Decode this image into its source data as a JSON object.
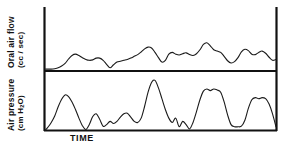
{
  "figure": {
    "background_color": "#ffffff",
    "line_color": "#1a1a1a",
    "axis_color": "#111111"
  },
  "chart_data": {
    "type": "line",
    "title": "",
    "subtitle": "",
    "xlabel": "TIME",
    "grid": false,
    "legend": null,
    "annotations": [],
    "panels": [
      {
        "id": "oral-air-flow",
        "ylabel": "Oral air flow",
        "yunits": "(cc / sec)",
        "ylabel_full": "Oral air flow (cc / sec)",
        "xlabel": "",
        "ylim": [
          0,
          1
        ],
        "xlim": [
          0,
          1
        ],
        "tick_labels_x": [],
        "tick_labels_y": [],
        "series": [
          {
            "name": "oral air flow",
            "x": [
              0.0,
              0.012,
              0.025,
              0.04,
              0.055,
              0.07,
              0.085,
              0.1,
              0.115,
              0.13,
              0.145,
              0.16,
              0.175,
              0.19,
              0.205,
              0.22,
              0.235,
              0.25,
              0.265,
              0.28,
              0.295,
              0.31,
              0.325,
              0.34,
              0.355,
              0.37,
              0.385,
              0.4,
              0.415,
              0.43,
              0.445,
              0.46,
              0.475,
              0.49,
              0.505,
              0.52,
              0.535,
              0.55,
              0.565,
              0.58,
              0.595,
              0.61,
              0.625,
              0.64,
              0.655,
              0.67,
              0.685,
              0.7,
              0.715,
              0.73,
              0.745,
              0.76,
              0.775,
              0.79,
              0.805,
              0.82,
              0.835,
              0.85,
              0.865,
              0.88,
              0.895,
              0.91,
              0.925,
              0.94,
              0.955,
              0.97,
              0.985,
              1.0
            ],
            "y": [
              0.02,
              0.02,
              0.02,
              0.03,
              0.05,
              0.09,
              0.15,
              0.25,
              0.33,
              0.36,
              0.33,
              0.28,
              0.24,
              0.22,
              0.23,
              0.27,
              0.27,
              0.22,
              0.13,
              0.05,
              0.12,
              0.18,
              0.2,
              0.22,
              0.24,
              0.27,
              0.31,
              0.35,
              0.41,
              0.48,
              0.52,
              0.5,
              0.4,
              0.28,
              0.18,
              0.22,
              0.36,
              0.4,
              0.36,
              0.34,
              0.37,
              0.39,
              0.35,
              0.33,
              0.37,
              0.46,
              0.58,
              0.62,
              0.55,
              0.46,
              0.43,
              0.4,
              0.31,
              0.21,
              0.16,
              0.19,
              0.28,
              0.41,
              0.47,
              0.44,
              0.36,
              0.35,
              0.4,
              0.43,
              0.38,
              0.29,
              0.22,
              0.24
            ]
          }
        ]
      },
      {
        "id": "air-pressure",
        "ylabel": "Air pressure",
        "yunits": "(cm H2O)",
        "ylabel_full": "Air pressure (cm H2O)",
        "xlabel": "TIME",
        "ylim": [
          0,
          1
        ],
        "xlim": [
          0,
          1
        ],
        "tick_labels_x": [],
        "tick_labels_y": [],
        "series": [
          {
            "name": "air pressure",
            "x": [
              0.0,
              0.012,
              0.025,
              0.04,
              0.055,
              0.07,
              0.085,
              0.1,
              0.115,
              0.13,
              0.145,
              0.16,
              0.175,
              0.19,
              0.205,
              0.22,
              0.235,
              0.25,
              0.265,
              0.28,
              0.295,
              0.31,
              0.325,
              0.34,
              0.355,
              0.37,
              0.385,
              0.4,
              0.415,
              0.43,
              0.445,
              0.46,
              0.475,
              0.49,
              0.505,
              0.52,
              0.535,
              0.55,
              0.565,
              0.58,
              0.595,
              0.61,
              0.625,
              0.64,
              0.655,
              0.67,
              0.685,
              0.7,
              0.715,
              0.73,
              0.745,
              0.76,
              0.775,
              0.79,
              0.805,
              0.82,
              0.835,
              0.85,
              0.865,
              0.88,
              0.895,
              0.91,
              0.925,
              0.94,
              0.955,
              0.97,
              0.985,
              1.0
            ],
            "y": [
              0.0,
              0.06,
              0.14,
              0.26,
              0.43,
              0.57,
              0.65,
              0.62,
              0.52,
              0.38,
              0.22,
              0.08,
              0.01,
              0.1,
              0.25,
              0.3,
              0.2,
              0.07,
              0.1,
              0.16,
              0.12,
              0.16,
              0.24,
              0.3,
              0.31,
              0.24,
              0.16,
              0.14,
              0.22,
              0.44,
              0.7,
              0.88,
              0.92,
              0.78,
              0.58,
              0.38,
              0.22,
              0.14,
              0.22,
              0.06,
              0.16,
              0.1,
              0.02,
              0.14,
              0.34,
              0.56,
              0.72,
              0.76,
              0.73,
              0.76,
              0.74,
              0.7,
              0.52,
              0.28,
              0.1,
              0.06,
              0.06,
              0.07,
              0.18,
              0.4,
              0.56,
              0.6,
              0.58,
              0.6,
              0.58,
              0.48,
              0.3,
              0.06
            ]
          }
        ]
      }
    ]
  },
  "labels": {
    "y_top_line1": "Oral air flow",
    "y_top_line2": "(cc / sec)",
    "y_bottom_line1": "Air pressure",
    "y_bottom_line2_pre": "(cm H",
    "y_bottom_line2_sub": "2",
    "y_bottom_line2_post": "O)",
    "x_axis": "TIME"
  }
}
